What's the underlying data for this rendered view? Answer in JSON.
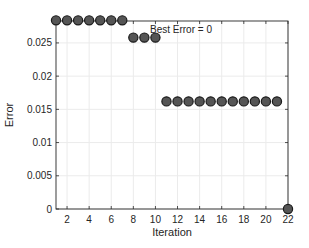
{
  "chart_data": {
    "type": "scatter",
    "title": "",
    "xlabel": "Iteration",
    "ylabel": "Error",
    "xlim": [
      1,
      22
    ],
    "ylim": [
      0,
      0.0283
    ],
    "grid": true,
    "legend": null,
    "x_ticks": [
      2,
      4,
      6,
      8,
      10,
      12,
      14,
      16,
      18,
      20,
      22
    ],
    "y_ticks": [
      0,
      0.005,
      0.01,
      0.015,
      0.02,
      0.025
    ],
    "y_tick_labels": [
      "0",
      "0.005",
      "0.01",
      "0.015",
      "0.02",
      "0.025"
    ],
    "annotations": [
      {
        "text": "Best Error = 0",
        "x": 12.5,
        "y": 0.0268
      }
    ],
    "series": [
      {
        "name": "Error",
        "marker": "circle",
        "color": "#555555",
        "x": [
          1,
          2,
          3,
          4,
          5,
          6,
          7,
          8,
          9,
          10,
          11,
          12,
          13,
          14,
          15,
          16,
          17,
          18,
          19,
          20,
          21,
          22
        ],
        "y": [
          0.0284,
          0.0284,
          0.0284,
          0.0284,
          0.0284,
          0.0284,
          0.0284,
          0.0258,
          0.0258,
          0.0258,
          0.0162,
          0.0162,
          0.0162,
          0.0162,
          0.0162,
          0.0162,
          0.0162,
          0.0162,
          0.0162,
          0.0162,
          0.0162,
          0
        ]
      }
    ]
  }
}
